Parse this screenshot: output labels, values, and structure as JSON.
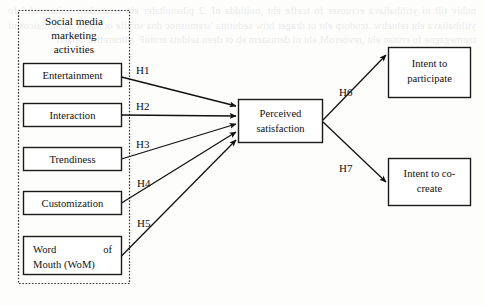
{
  "figure": {
    "type": "path-model-diagram",
    "caption": null,
    "background_ghost_text": "nuhiv tiil ni ytilibaliava ecruoser fo tceffe eht ,noitidda nI .2 pihsnoitaler eht setaredom noitamrofni fo ytilibaliava eht rehtehw  .tcudorp eht ot drager htiw sedutitta 'sremusnoc dna stroffe   ot sdeen aidem laicos ni tnemegagne fo erutan eht ,revoeroM   eht ni derusaem eb ot deen seiduts erutuF .yltnereffid detaert"
  },
  "group": {
    "title": "Social media marketing activities",
    "border_style": "dotted"
  },
  "antecedent_nodes": [
    {
      "id": "entertainment",
      "label": "Entertainment"
    },
    {
      "id": "interaction",
      "label": "Interaction"
    },
    {
      "id": "trendiness",
      "label": "Trendiness"
    },
    {
      "id": "customization",
      "label": "Customization"
    },
    {
      "id": "wom",
      "label": "Word of Mouth (WoM)",
      "line1_left": "Word",
      "line1_right": "of",
      "line2": "Mouth (WoM)"
    }
  ],
  "mediator_node": {
    "id": "perceived-satisfaction",
    "line1": "Perceived",
    "line2": "satisfaction"
  },
  "outcome_nodes": [
    {
      "id": "intent-to-participate",
      "line1": "Intent to",
      "line2": "participate"
    },
    {
      "id": "intent-to-co-create",
      "line1": "Intent to co-",
      "line2": "create"
    }
  ],
  "hypotheses": [
    {
      "id": "H1",
      "label": "H1",
      "from": "entertainment",
      "to": "perceived-satisfaction"
    },
    {
      "id": "H2",
      "label": "H2",
      "from": "interaction",
      "to": "perceived-satisfaction"
    },
    {
      "id": "H3",
      "label": "H3",
      "from": "trendiness",
      "to": "perceived-satisfaction"
    },
    {
      "id": "H4",
      "label": "H4",
      "from": "customization",
      "to": "perceived-satisfaction"
    },
    {
      "id": "H5",
      "label": "H5",
      "from": "wom",
      "to": "perceived-satisfaction"
    },
    {
      "id": "H6",
      "label": "H6",
      "from": "perceived-satisfaction",
      "to": "intent-to-participate"
    },
    {
      "id": "H7",
      "label": "H7",
      "from": "perceived-satisfaction",
      "to": "intent-to-co-create"
    }
  ],
  "colors": {
    "stroke": "#111111",
    "node_fill": "#ffffff",
    "group_stroke": "#333333",
    "page_background": "#fdfdfc"
  }
}
